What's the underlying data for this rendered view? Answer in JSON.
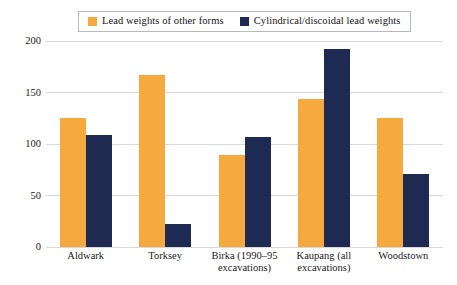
{
  "chart_data": {
    "type": "bar",
    "title": "",
    "subtitle": "",
    "xlabel": "",
    "ylabel": "",
    "ylim": [
      0,
      200
    ],
    "yticks": [
      0,
      50,
      100,
      150,
      200
    ],
    "ytick_labels": [
      "0",
      "50",
      "100",
      "150",
      "200"
    ],
    "grid": "horizontal",
    "legend_position": "top-center",
    "categories": [
      "Aldwark",
      "Torksey",
      "Birka (1990–95 excavations)",
      "Kaupang (all excavations)",
      "Woodstown"
    ],
    "category_lines": [
      [
        "Aldwark"
      ],
      [
        "Torksey"
      ],
      [
        "Birka (1990–95",
        "excavations)"
      ],
      [
        "Kaupang (all",
        "excavations)"
      ],
      [
        "Woodstown"
      ]
    ],
    "series": [
      {
        "name": "Lead weights of other forms",
        "color": "#f5a93f",
        "values": [
          125,
          167,
          89,
          144,
          125
        ]
      },
      {
        "name": "Cylindrical/discoidal lead weights",
        "color": "#1e2a52",
        "values": [
          109,
          22,
          107,
          192,
          71
        ]
      }
    ]
  },
  "legend": {
    "entries": [
      {
        "label": "Lead weights of other forms",
        "color": "#f5a93f"
      },
      {
        "label": "Cylindrical/discoidal lead weights",
        "color": "#1e2a52"
      }
    ]
  },
  "colors": {
    "series_orange": "#f5a93f",
    "series_navy": "#1e2a52",
    "gridline": "#d8d8d8",
    "axis": "#4a4a58",
    "legend_border": "#b9b9b9",
    "background": "#ffffff",
    "text": "#1a1a1a"
  }
}
